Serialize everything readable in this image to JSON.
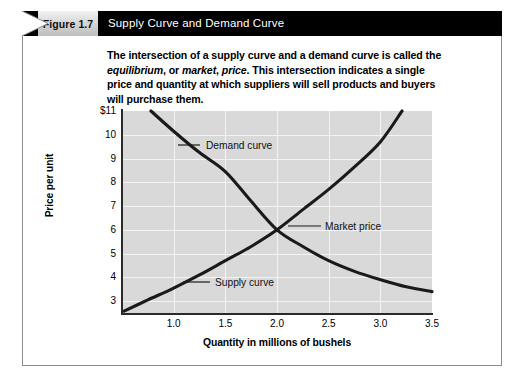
{
  "figure": {
    "number_label": "Figure 1.7",
    "title": "Supply Curve and Demand Curve",
    "caption_html": "The intersection of a supply curve and a demand curve is called the <i>equilibrium</i>, or <i>market</i>, <i>price</i>. This intersection indicates a single price and quantity at which suppliers will sell products and buyers will purchase them.",
    "header_bg": "#000000",
    "number_box_bg": "#cfcfcf",
    "frame_border": "#8b8b8b"
  },
  "chart_data": {
    "type": "line",
    "title": "Supply Curve and Demand Curve",
    "xlabel": "Quantity in millions of bushels",
    "ylabel": "Price per unit",
    "xlim": [
      0.5,
      3.5
    ],
    "ylim": [
      2.5,
      11
    ],
    "xticks": [
      "1.0",
      "1.5",
      "2.0",
      "2.5",
      "3.0",
      "3.5"
    ],
    "xtick_values": [
      1.0,
      1.5,
      2.0,
      2.5,
      3.0,
      3.5
    ],
    "yticks": [
      "$11",
      "10",
      "9",
      "8",
      "7",
      "6",
      "5",
      "4",
      "3"
    ],
    "ytick_values": [
      11,
      10,
      9,
      8,
      7,
      6,
      5,
      4,
      3
    ],
    "grid": true,
    "plot_bg": "#d9d9d9",
    "gridline_color": "#f4f4f4",
    "curve_color": "#1a1a1a",
    "legend": "annotations",
    "series": [
      {
        "name": "Demand curve",
        "label": "Demand curve",
        "x": [
          0.78,
          1.0,
          1.25,
          1.5,
          1.75,
          2.0,
          2.25,
          2.5,
          2.75,
          3.0,
          3.25,
          3.5
        ],
        "y": [
          11.0,
          10.15,
          9.25,
          8.45,
          7.2,
          6.0,
          5.3,
          4.7,
          4.25,
          3.9,
          3.6,
          3.4
        ]
      },
      {
        "name": "Supply curve",
        "label": "Supply curve",
        "x": [
          0.52,
          0.75,
          1.0,
          1.25,
          1.5,
          1.75,
          2.0,
          2.25,
          2.5,
          2.75,
          3.0,
          3.21
        ],
        "y": [
          2.58,
          3.05,
          3.55,
          4.1,
          4.7,
          5.3,
          6.0,
          6.85,
          7.7,
          8.65,
          9.7,
          11.0
        ]
      }
    ],
    "annotations": [
      {
        "label": "Demand curve",
        "x": 1.3,
        "y": 9.3,
        "note": "leader line to demand curve"
      },
      {
        "label": "Market price",
        "x": 2.0,
        "y": 6.0,
        "note": "equilibrium intersection point"
      },
      {
        "label": "Supply curve",
        "x": 1.45,
        "y": 4.55,
        "note": "leader line to supply curve"
      }
    ],
    "equilibrium": {
      "quantity": 2.0,
      "price": 6.0
    }
  },
  "annotations": {
    "demand": "Demand curve",
    "market": "Market price",
    "supply": "Supply curve"
  }
}
